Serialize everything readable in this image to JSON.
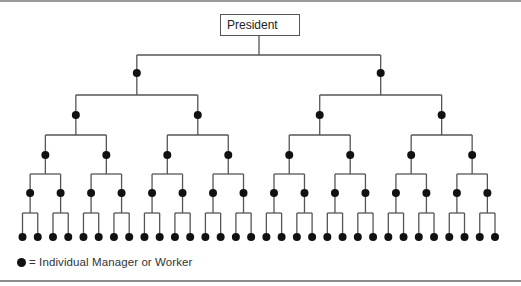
{
  "diagram": {
    "type": "hierarchical-org-chart",
    "root_label": "President",
    "levels_below_root": 5,
    "branching_factor": 2,
    "node_symbol": "filled-circle",
    "legend": {
      "symbol": "filled-circle",
      "text": "= Individual Manager or Worker"
    }
  },
  "colors": {
    "line": "#555555",
    "node": "#111111",
    "border": "#666666"
  }
}
